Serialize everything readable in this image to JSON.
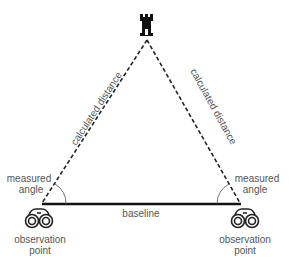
{
  "diagram": {
    "labels": {
      "left_side": "calculated distance",
      "right_side": "calculated distance",
      "baseline": "baseline",
      "left_angle_line1": "measured",
      "left_angle_line2": "angle",
      "right_angle_line1": "measured",
      "right_angle_line2": "angle",
      "left_point_line1": "observation",
      "left_point_line2": "point",
      "right_point_line1": "observation",
      "right_point_line2": "point"
    },
    "icons": {
      "target": "castle-tower-icon",
      "left_observer": "binoculars-icon",
      "right_observer": "binoculars-icon"
    },
    "colors": {
      "line": "#111111",
      "text": "#555555"
    }
  }
}
